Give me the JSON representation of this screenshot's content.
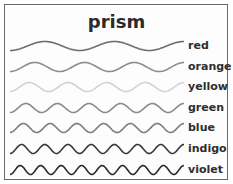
{
  "title": "prism",
  "waves": [
    {
      "label": "red",
      "cycles": 2.5,
      "color": "#6e6e6e",
      "y": 46
    },
    {
      "label": "orange",
      "cycles": 3.5,
      "color": "#8c8c8c",
      "y": 67
    },
    {
      "label": "yellow",
      "cycles": 4.5,
      "color": "#d2d2d2",
      "y": 87
    },
    {
      "label": "green",
      "cycles": 5.5,
      "color": "#8a8a8a",
      "y": 108
    },
    {
      "label": "blue",
      "cycles": 6.5,
      "color": "#7c7c7c",
      "y": 128
    },
    {
      "label": "indigo",
      "cycles": 7.5,
      "color": "#3a3a3a",
      "y": 149
    },
    {
      "label": "violet",
      "cycles": 8.5,
      "color": "#2a2a2a",
      "y": 170
    }
  ]
}
